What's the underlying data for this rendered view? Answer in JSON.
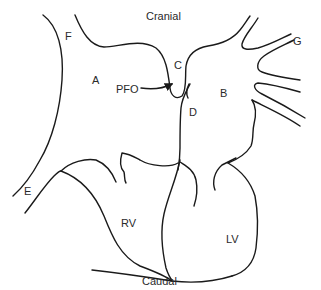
{
  "diagram": {
    "orientation": {
      "top": "Cranial",
      "bottom": "Caudal"
    },
    "labels": {
      "A": "A",
      "B": "B",
      "C": "C",
      "D": "D",
      "E": "E",
      "F": "F",
      "G": "G",
      "PFO": "PFO",
      "RV": "RV",
      "LV": "LV"
    },
    "colors": {
      "line": "#1a1a1a",
      "text": "#2a2a2a",
      "background": "#ffffff"
    }
  }
}
